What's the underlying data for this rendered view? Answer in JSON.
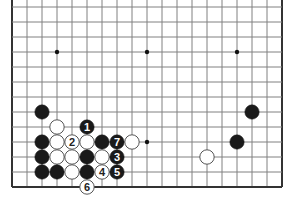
{
  "diagram": {
    "type": "go-board",
    "board_size": 19,
    "visible_region": "lower rows (bottom edge, left and right edges), top cropped",
    "grid": {
      "origin_x": 12,
      "bottom_y": 187,
      "spacing": 15,
      "columns": 19,
      "visible_rows": 13,
      "line_color": "#808080",
      "border_color": "#333333"
    },
    "star_points": [
      {
        "col": 3,
        "row": 9
      },
      {
        "col": 9,
        "row": 9
      },
      {
        "col": 15,
        "row": 9
      },
      {
        "col": 9,
        "row": 3
      }
    ],
    "stones": [
      {
        "color": "black",
        "col": 2,
        "row": 5,
        "label": ""
      },
      {
        "color": "white",
        "col": 3,
        "row": 4,
        "label": ""
      },
      {
        "color": "black",
        "col": 5,
        "row": 4,
        "label": "1"
      },
      {
        "color": "black",
        "col": 2,
        "row": 3,
        "label": ""
      },
      {
        "color": "white",
        "col": 3,
        "row": 3,
        "label": ""
      },
      {
        "color": "white",
        "col": 4,
        "row": 3,
        "label": "2"
      },
      {
        "color": "white",
        "col": 5,
        "row": 3,
        "label": ""
      },
      {
        "color": "black",
        "col": 6,
        "row": 3,
        "label": ""
      },
      {
        "color": "black",
        "col": 7,
        "row": 3,
        "label": "7"
      },
      {
        "color": "white",
        "col": 8,
        "row": 3,
        "label": ""
      },
      {
        "color": "black",
        "col": 2,
        "row": 2,
        "label": ""
      },
      {
        "color": "white",
        "col": 3,
        "row": 2,
        "label": ""
      },
      {
        "color": "white",
        "col": 4,
        "row": 2,
        "label": ""
      },
      {
        "color": "black",
        "col": 5,
        "row": 2,
        "label": ""
      },
      {
        "color": "white",
        "col": 6,
        "row": 2,
        "label": ""
      },
      {
        "color": "black",
        "col": 7,
        "row": 2,
        "label": "3"
      },
      {
        "color": "black",
        "col": 2,
        "row": 1,
        "label": ""
      },
      {
        "color": "black",
        "col": 3,
        "row": 1,
        "label": ""
      },
      {
        "color": "white",
        "col": 4,
        "row": 1,
        "label": ""
      },
      {
        "color": "black",
        "col": 5,
        "row": 1,
        "label": ""
      },
      {
        "color": "white",
        "col": 6,
        "row": 1,
        "label": "4"
      },
      {
        "color": "black",
        "col": 7,
        "row": 1,
        "label": "5"
      },
      {
        "color": "white",
        "col": 5,
        "row": 0,
        "label": "6"
      },
      {
        "color": "black",
        "col": 16,
        "row": 5,
        "label": ""
      },
      {
        "color": "black",
        "col": 15,
        "row": 3,
        "label": ""
      },
      {
        "color": "white",
        "col": 13,
        "row": 2,
        "label": ""
      }
    ],
    "colors": {
      "black_stone": "#1a1a1a",
      "white_stone": "#ffffff",
      "white_stone_stroke": "#555555",
      "label_on_black": "#ffffff",
      "label_on_white": "#222222",
      "star_point": "#111111"
    }
  }
}
